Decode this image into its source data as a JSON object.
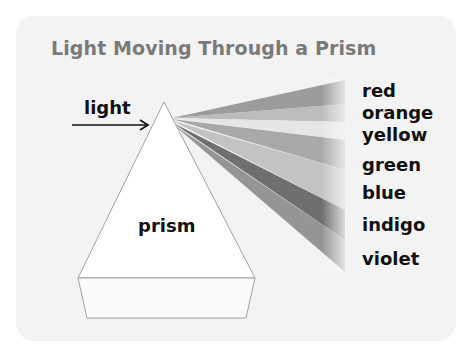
{
  "title": "Light Moving Through a Prism",
  "labels": {
    "light": "light",
    "prism": "prism"
  },
  "spectrum": [
    {
      "name": "red",
      "top": 81
    },
    {
      "name": "orange",
      "top": 103
    },
    {
      "name": "yellow",
      "top": 125
    },
    {
      "name": "green",
      "top": 155
    },
    {
      "name": "blue",
      "top": 183
    },
    {
      "name": "indigo",
      "top": 215
    },
    {
      "name": "violet",
      "top": 249
    }
  ],
  "colors": {
    "card": "#f3f3f3",
    "title": "#7a7a7a",
    "prism_outline": "#a0a0a0"
  }
}
